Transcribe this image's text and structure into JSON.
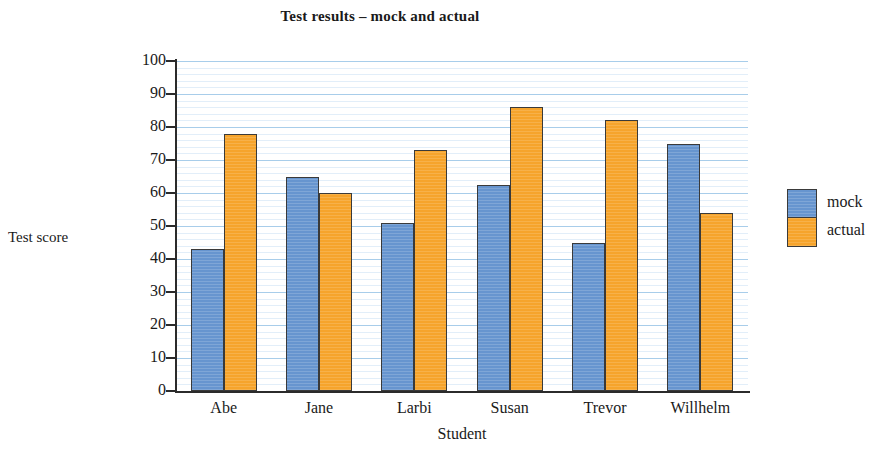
{
  "chart_data": {
    "type": "bar",
    "title": "Test results – mock and actual",
    "xlabel": "Student",
    "ylabel": "Test score",
    "categories": [
      "Abe",
      "Jane",
      "Larbi",
      "Susan",
      "Trevor",
      "Willhelm"
    ],
    "series": [
      {
        "name": "mock",
        "color": "#6795cf",
        "values": [
          43,
          65,
          51,
          62.5,
          45,
          75
        ]
      },
      {
        "name": "actual",
        "color": "#f6a42c",
        "values": [
          78,
          60,
          73,
          86,
          82,
          54
        ]
      }
    ],
    "ylim": [
      0,
      100
    ],
    "ytick_step": 10,
    "yticks": [
      100,
      90,
      80,
      70,
      60,
      50,
      40,
      30,
      20,
      10,
      0
    ],
    "ytick_labels": [
      "100",
      "90",
      "80",
      "70",
      "60",
      "50",
      "40",
      "30",
      "20",
      "10",
      "0"
    ],
    "grid": true,
    "grid_minor_step": 2,
    "legend_position": "right",
    "legend_entries": [
      "mock",
      "actual"
    ]
  }
}
